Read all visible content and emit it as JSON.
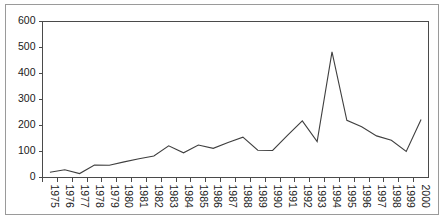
{
  "chart_data": {
    "type": "line",
    "title": "",
    "subtitle": "",
    "xlabel": "",
    "ylabel": "",
    "legend": [],
    "legend_position": "none",
    "grid": false,
    "xlim": [
      1975,
      2000
    ],
    "ylim": [
      0,
      600
    ],
    "y_ticks": [
      0,
      100,
      200,
      300,
      400,
      500,
      600
    ],
    "y_tick_labels": [
      "0",
      "100",
      "200",
      "300",
      "400",
      "500",
      "600"
    ],
    "x_tick_labels": [
      "1975",
      "1976",
      "1977",
      "1978",
      "1979",
      "1980",
      "1981",
      "1982",
      "1983",
      "1984",
      "1985",
      "1986",
      "1987",
      "1988",
      "1989",
      "1990",
      "1991",
      "1992",
      "1993",
      "1994",
      "1995",
      "1996",
      "1997",
      "1998",
      "1999",
      "2000"
    ],
    "x_tick_rotation": 90,
    "categories": [
      1975,
      1976,
      1977,
      1978,
      1979,
      1980,
      1981,
      1982,
      1983,
      1984,
      1985,
      1986,
      1987,
      1988,
      1989,
      1990,
      1991,
      1992,
      1993,
      1994,
      1995,
      1996,
      1997,
      1998,
      1999,
      2000
    ],
    "values": [
      20,
      30,
      15,
      48,
      47,
      60,
      72,
      83,
      122,
      95,
      125,
      112,
      135,
      155,
      105,
      104,
      162,
      218,
      138,
      483,
      220,
      195,
      160,
      143,
      100,
      223
    ],
    "series": [
      {
        "name": "series-1",
        "color": "#3f3f3f",
        "values": [
          20,
          30,
          15,
          48,
          47,
          60,
          72,
          83,
          122,
          95,
          125,
          112,
          135,
          155,
          105,
          104,
          162,
          218,
          138,
          483,
          220,
          195,
          160,
          143,
          100,
          223
        ]
      }
    ],
    "annotations": []
  },
  "colors": {
    "line": "#3f3f3f",
    "axis": "#4a4a4a",
    "text": "#1a1a1a",
    "border": "#9a9a9a",
    "background": "#ffffff"
  }
}
